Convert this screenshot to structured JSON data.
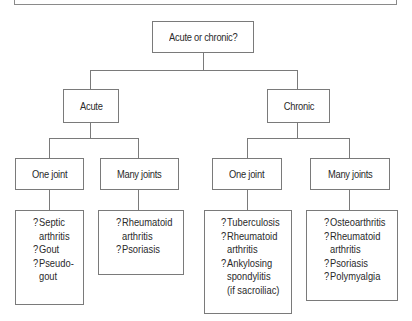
{
  "diagram": {
    "type": "decision-tree",
    "root": {
      "label": "Acute or chronic?"
    },
    "branches": [
      {
        "label": "Acute",
        "children": [
          {
            "label": "One joint",
            "leaf": {
              "items": [
                {
                  "marker": "?",
                  "lines": [
                    "Septic",
                    "arthritis"
                  ]
                },
                {
                  "marker": "?",
                  "lines": [
                    "Gout"
                  ]
                },
                {
                  "marker": "?",
                  "lines": [
                    "Pseudo-",
                    "gout"
                  ]
                }
              ]
            }
          },
          {
            "label": "Many joints",
            "leaf": {
              "items": [
                {
                  "marker": "?",
                  "lines": [
                    "Rheumatoid",
                    "arthritis"
                  ]
                },
                {
                  "marker": "?",
                  "lines": [
                    "Psoriasis"
                  ]
                }
              ]
            }
          }
        ]
      },
      {
        "label": "Chronic",
        "children": [
          {
            "label": "One joint",
            "leaf": {
              "items": [
                {
                  "marker": "?",
                  "lines": [
                    "Tuberculosis"
                  ]
                },
                {
                  "marker": "?",
                  "lines": [
                    "Rheumatoid",
                    "arthritis"
                  ]
                },
                {
                  "marker": "?",
                  "lines": [
                    "Ankylosing",
                    "spondylitis",
                    "(if sacroiliac)"
                  ]
                }
              ]
            }
          },
          {
            "label": "Many joints",
            "leaf": {
              "items": [
                {
                  "marker": "?",
                  "lines": [
                    "Osteoarthritis"
                  ]
                },
                {
                  "marker": "?",
                  "lines": [
                    "Rheumatoid",
                    "arthritis"
                  ]
                },
                {
                  "marker": "?",
                  "lines": [
                    "Psoriasis"
                  ]
                },
                {
                  "marker": "?",
                  "lines": [
                    "Polymyalgia"
                  ]
                }
              ]
            }
          }
        ]
      }
    ]
  }
}
